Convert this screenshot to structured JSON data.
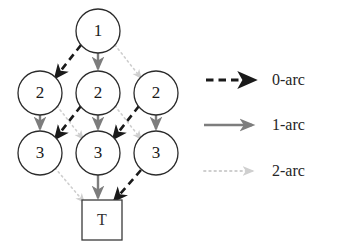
{
  "figure": {
    "type": "directed-acyclic-graph",
    "background_color": "#ffffff"
  },
  "colors": {
    "arc0": "#1a1a1a",
    "arc1": "#7d7d7d",
    "arc2": "#cfcfcf",
    "node_stroke": "#2b2b2b",
    "node_fill": "#ffffff",
    "text": "#1a1a1a"
  },
  "graph": {
    "nodes": [
      {
        "id": "n1",
        "label": "1",
        "shape": "circle",
        "cx": 98,
        "cy": 31,
        "r": 22
      },
      {
        "id": "n2a",
        "label": "2",
        "shape": "circle",
        "cx": 40,
        "cy": 93,
        "r": 22
      },
      {
        "id": "n2b",
        "label": "2",
        "shape": "circle",
        "cx": 98,
        "cy": 93,
        "r": 22
      },
      {
        "id": "n2c",
        "label": "2",
        "shape": "circle",
        "cx": 156,
        "cy": 93,
        "r": 22
      },
      {
        "id": "n3a",
        "label": "3",
        "shape": "circle",
        "cx": 40,
        "cy": 153,
        "r": 22
      },
      {
        "id": "n3b",
        "label": "3",
        "shape": "circle",
        "cx": 98,
        "cy": 153,
        "r": 22
      },
      {
        "id": "n3c",
        "label": "3",
        "shape": "circle",
        "cx": 156,
        "cy": 153,
        "r": 22
      },
      {
        "id": "term",
        "label": "T",
        "shape": "square",
        "cx": 102,
        "cy": 220,
        "size": 40
      }
    ],
    "edges": [
      {
        "from": "n1",
        "to": "n2a",
        "arc": "0-arc"
      },
      {
        "from": "n1",
        "to": "n2b",
        "arc": "1-arc"
      },
      {
        "from": "n1",
        "to": "n2c",
        "arc": "2-arc"
      },
      {
        "from": "n2b",
        "to": "n3a",
        "arc": "0-arc"
      },
      {
        "from": "n2a",
        "to": "n3a",
        "arc": "1-arc"
      },
      {
        "from": "n2a",
        "to": "n3b",
        "arc": "2-arc"
      },
      {
        "from": "n2c",
        "to": "n3b",
        "arc": "0-arc"
      },
      {
        "from": "n2b",
        "to": "n3b",
        "arc": "1-arc"
      },
      {
        "from": "n2c",
        "to": "n3c",
        "arc": "1-arc"
      },
      {
        "from": "n2b",
        "to": "n3c",
        "arc": "2-arc"
      },
      {
        "from": "n3c",
        "to": "term",
        "arc": "0-arc"
      },
      {
        "from": "n3b",
        "to": "term",
        "arc": "1-arc"
      },
      {
        "from": "n3a",
        "to": "term",
        "arc": "2-arc"
      }
    ]
  },
  "legend": {
    "items": [
      {
        "key": "arc0",
        "label": "0-arc",
        "style": "dashed",
        "color": "#1a1a1a"
      },
      {
        "key": "arc1",
        "label": "1-arc",
        "style": "solid",
        "color": "#7d7d7d"
      },
      {
        "key": "arc2",
        "label": "2-arc",
        "style": "dotted",
        "color": "#cfcfcf"
      }
    ]
  }
}
